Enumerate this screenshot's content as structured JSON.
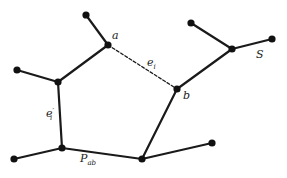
{
  "diagram": {
    "nodes": [
      {
        "id": "top-leaf"
      },
      {
        "id": "a",
        "label": "a"
      },
      {
        "id": "left-leaf"
      },
      {
        "id": "left-node"
      },
      {
        "id": "b",
        "label": "b"
      },
      {
        "id": "s-node"
      },
      {
        "id": "s-top-leaf"
      },
      {
        "id": "s-right-leaf"
      },
      {
        "id": "bottom-left-node"
      },
      {
        "id": "bottom-left-leaf"
      },
      {
        "id": "bottom-node"
      },
      {
        "id": "bottom-right-leaf"
      }
    ],
    "edges": [
      {
        "from": "top-leaf",
        "to": "a",
        "style": "solid"
      },
      {
        "from": "a",
        "to": "b",
        "style": "dashed",
        "label": "e_i"
      },
      {
        "from": "a",
        "to": "left-node",
        "style": "solid"
      },
      {
        "from": "left-leaf",
        "to": "left-node",
        "style": "solid"
      },
      {
        "from": "left-node",
        "to": "bottom-left-node",
        "style": "solid",
        "label": "e_i'"
      },
      {
        "from": "bottom-left-leaf",
        "to": "bottom-left-node",
        "style": "solid"
      },
      {
        "from": "bottom-left-node",
        "to": "bottom-node",
        "style": "solid",
        "label": "P_ab"
      },
      {
        "from": "bottom-node",
        "to": "b",
        "style": "solid"
      },
      {
        "from": "bottom-node",
        "to": "bottom-right-leaf",
        "style": "solid"
      },
      {
        "from": "b",
        "to": "s-node",
        "style": "solid"
      },
      {
        "from": "s-top-leaf",
        "to": "s-node",
        "style": "solid"
      },
      {
        "from": "s-node",
        "to": "s-right-leaf",
        "style": "solid"
      }
    ],
    "labels": {
      "a": "a",
      "b": "b",
      "S": "S",
      "e_i": {
        "main": "e",
        "sub": "i"
      },
      "e_i_prime": {
        "main": "e",
        "sub": "i",
        "sup": "′"
      },
      "P_ab": {
        "main": "P",
        "sub": "ab"
      }
    }
  }
}
